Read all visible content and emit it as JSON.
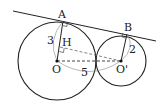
{
  "diagram": {
    "points": {
      "A": {
        "label": "A",
        "x": 63,
        "y": 21
      },
      "B": {
        "label": "B",
        "x": 127,
        "y": 34
      },
      "H": {
        "label": "H",
        "x": 60,
        "y": 47
      },
      "O": {
        "label": "O",
        "x": 57,
        "y": 61
      },
      "O2": {
        "label": "O'",
        "x": 121,
        "y": 61
      }
    },
    "circles": [
      {
        "center": "O",
        "radius": 39
      },
      {
        "center": "O'",
        "radius": 25
      }
    ],
    "lengths": {
      "OA": "3",
      "O2B": "2",
      "OO2": "5"
    },
    "colors": {
      "stroke": "#222222",
      "dashed": "#555555"
    }
  }
}
